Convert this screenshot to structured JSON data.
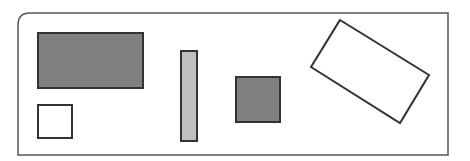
{
  "canvas": {
    "width": 470,
    "height": 161,
    "background": "#ffffff"
  },
  "frame": {
    "x": 18,
    "y": 13,
    "w": 430,
    "h": 142,
    "stroke": "#555555",
    "stroke_width": 1.5,
    "corner": "top-left-rounded"
  },
  "shapes": [
    {
      "id": "large-dark-rectangle",
      "type": "rect",
      "x": 38,
      "y": 33,
      "w": 105,
      "h": 55,
      "fill": "#808080",
      "stroke": "#333333"
    },
    {
      "id": "small-white-square",
      "type": "rect",
      "x": 38,
      "y": 105,
      "w": 34,
      "h": 33,
      "fill": "#ffffff",
      "stroke": "#333333"
    },
    {
      "id": "tall-light-bar",
      "type": "rect",
      "x": 181,
      "y": 51,
      "w": 16,
      "h": 90,
      "fill": "#c0c0c0",
      "stroke": "#333333"
    },
    {
      "id": "medium-dark-square",
      "type": "rect",
      "x": 236,
      "y": 77,
      "w": 44,
      "h": 45,
      "fill": "#808080",
      "stroke": "#333333"
    },
    {
      "id": "rotated-white-rectangle",
      "type": "polygon",
      "points": "340,20 429,75 400,123 311,67",
      "fill": "#ffffff",
      "stroke": "#333333"
    }
  ]
}
